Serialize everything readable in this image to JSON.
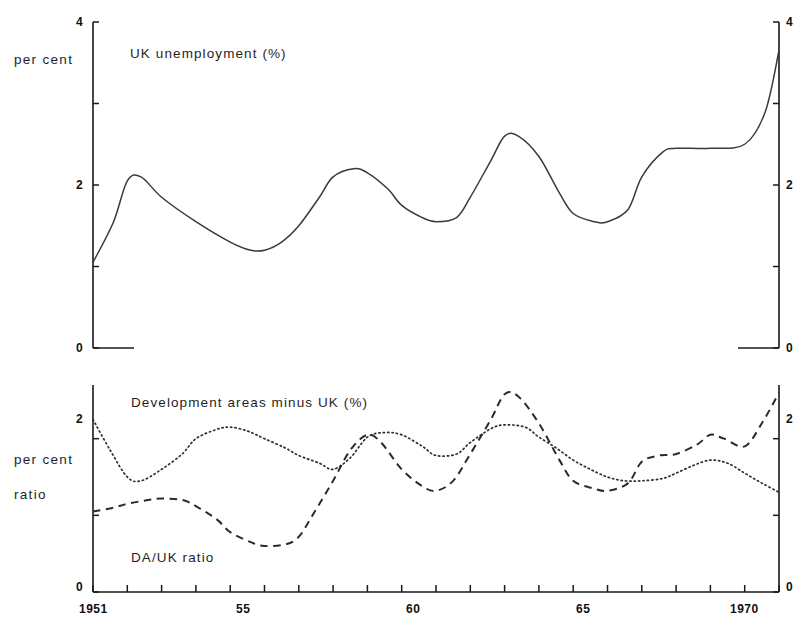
{
  "figure": {
    "caption_top": "UK unemployment (%)",
    "caption_bottom_dotted": "Development areas minus UK (%)",
    "caption_bottom_dashed": "DA/UK ratio",
    "axis_label_top": "per cent",
    "axis_label_bottom_line1": "per cent",
    "axis_label_bottom_line2": "ratio",
    "ink_color": "#1a1a1a",
    "background_color": "#ffffff"
  },
  "chart_data": [
    {
      "type": "line",
      "title": "UK unemployment (%)",
      "xlabel": "",
      "ylabel": "per cent",
      "ylim": [
        0,
        4
      ],
      "xlim": [
        1951,
        1971
      ],
      "grid": false,
      "legend": "none",
      "y_ticks": [
        0,
        1,
        2,
        3,
        4
      ],
      "y_tick_labels": [
        "0",
        "",
        "2",
        "",
        "4"
      ],
      "x_ticks": [
        1951,
        1952,
        1953,
        1954,
        1955,
        1956,
        1957,
        1958,
        1959,
        1960,
        1961,
        1962,
        1963,
        1964,
        1965,
        1966,
        1967,
        1968,
        1969,
        1970,
        1971
      ],
      "x_tick_labels": [
        "1951",
        "",
        "",
        "",
        "55",
        "",
        "",
        "",
        "",
        "60",
        "",
        "",
        "",
        "",
        "65",
        "",
        "",
        "",
        "",
        "1970",
        ""
      ],
      "series": [
        {
          "name": "UK unemployment (%)",
          "style": "solid",
          "x": [
            1951,
            1951.6,
            1952,
            1952.4,
            1953,
            1954,
            1955,
            1955.6,
            1956,
            1956.5,
            1957,
            1957.6,
            1958,
            1958.6,
            1959,
            1959.6,
            1960,
            1960.6,
            1961,
            1961.6,
            1962,
            1962.6,
            1963,
            1963.4,
            1964,
            1964.6,
            1965,
            1965.6,
            1966,
            1966.6,
            1967,
            1967.6,
            1968,
            1969,
            1970,
            1970.6,
            1971
          ],
          "values": [
            1.05,
            1.55,
            2.05,
            2.1,
            1.85,
            1.55,
            1.3,
            1.2,
            1.2,
            1.3,
            1.5,
            1.85,
            2.1,
            2.2,
            2.15,
            1.95,
            1.75,
            1.6,
            1.55,
            1.6,
            1.85,
            2.3,
            2.6,
            2.6,
            2.35,
            1.9,
            1.65,
            1.55,
            1.55,
            1.7,
            2.1,
            2.4,
            2.45,
            2.45,
            2.5,
            2.9,
            3.65
          ]
        }
      ]
    },
    {
      "type": "line",
      "title": "",
      "xlabel": "",
      "ylabel": "per cent ratio",
      "ylim": [
        0,
        2.7
      ],
      "xlim": [
        1951,
        1971
      ],
      "grid": false,
      "legend": "inline-annotations",
      "y_ticks": [
        0,
        1,
        2
      ],
      "y_tick_labels": [
        "0",
        "",
        "2"
      ],
      "x_ticks": [
        1951,
        1952,
        1953,
        1954,
        1955,
        1956,
        1957,
        1958,
        1959,
        1960,
        1961,
        1962,
        1963,
        1964,
        1965,
        1966,
        1967,
        1968,
        1969,
        1970,
        1971
      ],
      "x_tick_labels": [
        "1951",
        "",
        "",
        "",
        "55",
        "",
        "",
        "",
        "",
        "60",
        "",
        "",
        "",
        "",
        "65",
        "",
        "",
        "",
        "",
        "1970",
        ""
      ],
      "series": [
        {
          "name": "Development areas minus UK (%)",
          "style": "dotted",
          "x": [
            1951,
            1951.5,
            1952,
            1952.4,
            1953,
            1953.6,
            1954,
            1954.6,
            1955,
            1955.5,
            1956,
            1956.6,
            1957,
            1957.6,
            1958,
            1958.5,
            1959,
            1959.5,
            1960,
            1960.6,
            1961,
            1961.6,
            1962,
            1962.6,
            1963,
            1963.6,
            1964,
            1964.5,
            1965,
            1965.5,
            1966,
            1966.5,
            1967,
            1967.6,
            1968,
            1968.5,
            1969,
            1969.5,
            1970,
            1970.5,
            1971
          ],
          "values": [
            2.25,
            1.85,
            1.5,
            1.45,
            1.6,
            1.8,
            2.0,
            2.12,
            2.15,
            2.1,
            2.0,
            1.88,
            1.78,
            1.68,
            1.6,
            1.75,
            2.02,
            2.08,
            2.05,
            1.9,
            1.78,
            1.8,
            1.95,
            2.13,
            2.18,
            2.15,
            2.02,
            1.88,
            1.72,
            1.6,
            1.5,
            1.45,
            1.45,
            1.48,
            1.55,
            1.65,
            1.72,
            1.68,
            1.55,
            1.42,
            1.3
          ]
        },
        {
          "name": "DA/UK ratio",
          "style": "dashed",
          "x": [
            1951,
            1951.6,
            1952,
            1952.6,
            1953,
            1953.6,
            1954,
            1954.6,
            1955,
            1955.6,
            1956,
            1956.6,
            1957,
            1957.4,
            1958,
            1958.5,
            1959,
            1959.4,
            1960,
            1960.6,
            1961,
            1961.5,
            1962,
            1962.6,
            1963,
            1963.4,
            1964,
            1964.6,
            1965,
            1965.6,
            1966,
            1966.6,
            1967,
            1967.5,
            1968,
            1968.6,
            1969,
            1969.4,
            1970,
            1970.5,
            1971
          ],
          "values": [
            1.05,
            1.1,
            1.15,
            1.2,
            1.22,
            1.2,
            1.12,
            0.95,
            0.78,
            0.65,
            0.6,
            0.62,
            0.72,
            1.0,
            1.45,
            1.85,
            2.05,
            1.95,
            1.6,
            1.38,
            1.32,
            1.45,
            1.8,
            2.25,
            2.58,
            2.55,
            2.2,
            1.72,
            1.45,
            1.35,
            1.32,
            1.42,
            1.7,
            1.78,
            1.8,
            1.92,
            2.05,
            2.0,
            1.9,
            2.2,
            2.6
          ]
        }
      ]
    }
  ]
}
